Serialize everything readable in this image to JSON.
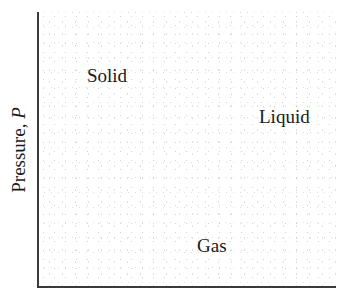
{
  "diagram": {
    "type": "phase-diagram",
    "y_axis": {
      "label_text": "Pressure, ",
      "label_variable": "P"
    },
    "x_axis": {
      "label_text": ""
    },
    "regions": [
      {
        "name": "solid",
        "label": "Solid"
      },
      {
        "name": "liquid",
        "label": "Liquid"
      },
      {
        "name": "gas",
        "label": "Gas"
      }
    ],
    "colors": {
      "axis": "#3a3a3a",
      "text": "#1a1a1a",
      "background": "#ffffff",
      "stipple": "#aaaaaa"
    }
  }
}
